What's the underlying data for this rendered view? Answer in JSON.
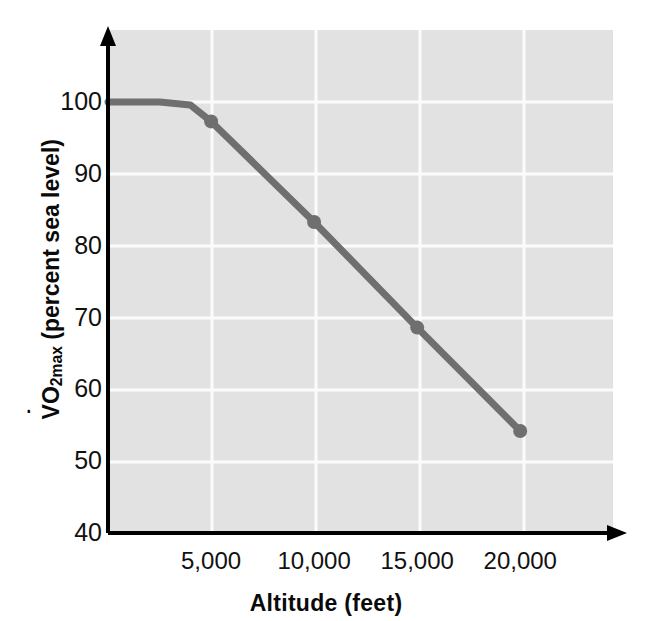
{
  "chart_data": {
    "type": "line",
    "title": "",
    "subtitle": "",
    "xlabel": "Altitude (feet)",
    "ylabel": "V̇O2max (percent sea level)",
    "ylabel_parts": {
      "v": "V",
      "o": "O",
      "sub": "2max",
      "rest": " (percent sea level)"
    },
    "xlim": [
      0,
      24500
    ],
    "ylim": [
      40,
      106
    ],
    "grid": true,
    "legend": null,
    "xticks": [
      5000,
      10000,
      15000,
      20000
    ],
    "xtick_labels": [
      "5,000",
      "10,000",
      "15,000",
      "20,000"
    ],
    "yticks": [
      40,
      50,
      60,
      70,
      80,
      90,
      100
    ],
    "ytick_labels": [
      "40",
      "50",
      "60",
      "70",
      "80",
      "90",
      "100"
    ],
    "series": [
      {
        "name": "VO2max vs altitude",
        "color": "#6f6f6f",
        "line_width": 7,
        "marker": "circle",
        "marker_size": 14,
        "x": [
          0,
          2500,
          4000,
          5000,
          10000,
          15000,
          20000
        ],
        "y": [
          100,
          100,
          99.6,
          97.3,
          83.3,
          68.6,
          54.2
        ],
        "marked_points": [
          {
            "x": 5000,
            "y": 97.3,
            "label": "5,000 ft"
          },
          {
            "x": 10000,
            "y": 83.3,
            "label": "10,000 ft"
          },
          {
            "x": 15000,
            "y": 68.6,
            "label": "15,000 ft"
          },
          {
            "x": 20000,
            "y": 54.2,
            "label": "20,000 ft"
          }
        ]
      }
    ],
    "colors": {
      "plot_background": "#e2e2e2",
      "gridline": "#fcfcfc",
      "axis": "#000000",
      "line": "#6f6f6f",
      "text": "#111111"
    }
  }
}
